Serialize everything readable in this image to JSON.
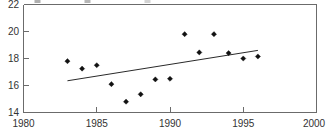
{
  "chart_data": {
    "type": "scatter",
    "title": "",
    "xlabel": "",
    "ylabel": "",
    "xlim": [
      1980,
      2000
    ],
    "ylim": [
      14,
      22
    ],
    "xticks": [
      1980,
      1985,
      1990,
      1995,
      2000
    ],
    "xtick_labels": [
      "1980",
      "1985",
      "1990",
      "1995",
      "2000"
    ],
    "yticks": [
      14,
      16,
      18,
      20,
      22
    ],
    "ytick_labels": [
      "14",
      "16",
      "18",
      "20",
      "22"
    ],
    "grid": false,
    "legend": null,
    "marker_style": "filled-diamond",
    "x": [
      1983,
      1984,
      1985,
      1986,
      1987,
      1988,
      1989,
      1990,
      1991,
      1992,
      1993,
      1994,
      1995,
      1996
    ],
    "values": [
      17.8,
      17.25,
      17.5,
      16.1,
      14.8,
      15.35,
      16.45,
      16.5,
      19.8,
      18.45,
      19.8,
      18.4,
      18.0,
      18.15
    ],
    "series": [
      {
        "name": "observations",
        "type": "scatter",
        "x": [
          1983,
          1984,
          1985,
          1986,
          1987,
          1988,
          1989,
          1990,
          1991,
          1992,
          1993,
          1994,
          1995,
          1996
        ],
        "values": [
          17.8,
          17.25,
          17.5,
          16.1,
          14.8,
          15.35,
          16.45,
          16.5,
          19.8,
          18.45,
          19.8,
          18.4,
          18.0,
          18.15
        ]
      },
      {
        "name": "trend-line",
        "type": "line",
        "x": [
          1983,
          1996
        ],
        "values": [
          16.35,
          18.6
        ]
      }
    ],
    "annotations": []
  },
  "frame": {
    "border_color": "#6b6b6b",
    "marker_color": "#111111",
    "trend_color": "#2a2a2a",
    "background": "#ffffff"
  }
}
